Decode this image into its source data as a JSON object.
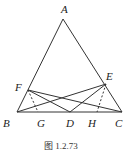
{
  "figure": {
    "caption": "图 1.2.73",
    "points": {
      "A": {
        "label": "A",
        "x": 63,
        "y": 19
      },
      "B": {
        "label": "B",
        "x": 17,
        "y": 112
      },
      "C": {
        "label": "C",
        "x": 122,
        "y": 112
      },
      "D": {
        "label": "D",
        "x": 70,
        "y": 112
      },
      "E": {
        "label": "E",
        "x": 106,
        "y": 84
      },
      "F": {
        "label": "F",
        "x": 28,
        "y": 90
      },
      "G": {
        "label": "G",
        "x": 38,
        "y": 112
      },
      "H": {
        "label": "H",
        "x": 97,
        "y": 112
      }
    },
    "solid_segments": [
      "AB",
      "AC",
      "BC",
      "BE",
      "CF",
      "DE",
      "DF"
    ],
    "dashed_segments": [
      "FG",
      "EH"
    ],
    "colors": {
      "stroke": "#333333",
      "background": "#ffffff"
    }
  }
}
